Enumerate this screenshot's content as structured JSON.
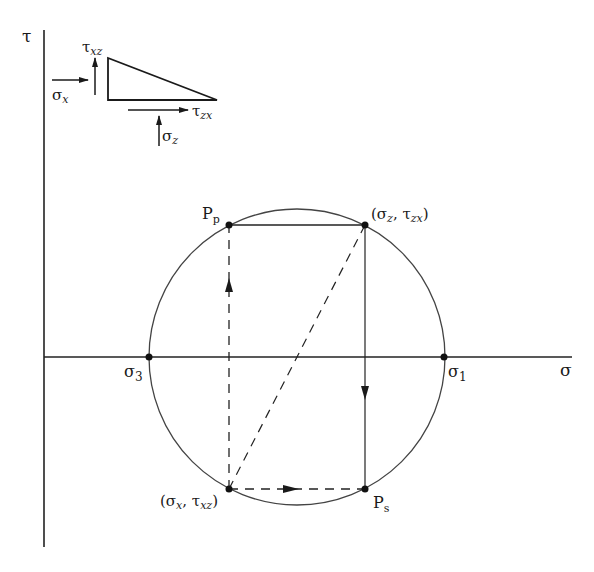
{
  "diagram": {
    "axes": {
      "vertical_label": "τ",
      "horizontal_label": "σ"
    },
    "points": {
      "sigma3": {
        "label": "σ",
        "sub": "3"
      },
      "sigma1": {
        "label": "σ",
        "sub": "1"
      },
      "pole_p": {
        "label": "P",
        "sub": "p"
      },
      "pole_s": {
        "label": "P",
        "sub": "s"
      },
      "z_face": {
        "open": "(σ",
        "sub1": "z",
        "mid": ", τ",
        "sub2": "zx",
        "close": ")"
      },
      "x_face": {
        "open": "(σ",
        "sub1": "x",
        "mid": ", τ",
        "sub2": "xz",
        "close": ")"
      }
    },
    "element_inset": {
      "sigma_x": {
        "label": "σ",
        "sub": "x"
      },
      "tau_xz": {
        "label": "τ",
        "sub": "xz"
      },
      "tau_zx": {
        "label": "τ",
        "sub": "zx"
      },
      "sigma_z": {
        "label": "σ",
        "sub": "z"
      }
    },
    "colors": {
      "ink": "#1a1a1a",
      "circle": "#444444",
      "background": "#ffffff"
    }
  }
}
